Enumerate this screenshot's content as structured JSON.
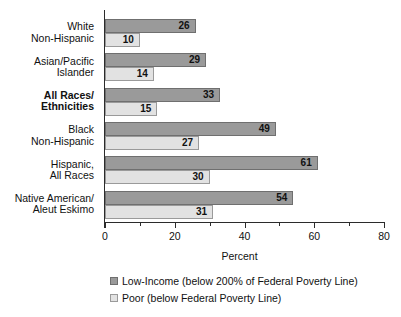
{
  "chart_data": {
    "type": "bar",
    "orientation": "horizontal",
    "title": "",
    "xlabel": "Percent",
    "ylabel": "",
    "xlim": [
      0,
      80
    ],
    "xticks": [
      0,
      20,
      40,
      60,
      80
    ],
    "xtick_labels": [
      "0",
      "20",
      "40",
      "60",
      "80"
    ],
    "minor_xticks": [
      10,
      30,
      50,
      70
    ],
    "grid": false,
    "legend_position": "bottom",
    "categories": [
      "White\nNon-Hispanic",
      "Asian/Pacific\nIslander",
      "All Races/\nEthnicities",
      "Black\nNon-Hispanic",
      "Hispanic,\nAll Races",
      "Native American/\nAleut Eskimo"
    ],
    "series": [
      {
        "name": "Low-Income (below 200% of Federal Poverty Line)",
        "color": "#9a9a9a",
        "values": [
          26,
          29,
          33,
          49,
          61,
          54
        ]
      },
      {
        "name": "Poor (below Federal Poverty Line)",
        "color": "#e2e2e2",
        "values": [
          10,
          14,
          15,
          27,
          30,
          31
        ]
      }
    ]
  },
  "categories": [
    {
      "line1": "White",
      "line2": "Non-Hispanic",
      "bold": false
    },
    {
      "line1": "Asian/Pacific",
      "line2": "Islander",
      "bold": false
    },
    {
      "line1": "All Races/",
      "line2": "Ethnicities",
      "bold": true
    },
    {
      "line1": "Black",
      "line2": "Non-Hispanic",
      "bold": false
    },
    {
      "line1": "Hispanic,",
      "line2": "All Races",
      "bold": false
    },
    {
      "line1": "Native American/",
      "line2": "Aleut Eskimo",
      "bold": false
    }
  ],
  "values": {
    "low_income": [
      "26",
      "29",
      "33",
      "49",
      "61",
      "54"
    ],
    "poor": [
      "10",
      "14",
      "15",
      "27",
      "30",
      "31"
    ]
  },
  "axis": {
    "title": "Percent",
    "tick_labels": [
      "0",
      "20",
      "40",
      "60",
      "80"
    ]
  },
  "legend": [
    {
      "label": "Low-Income (below 200% of Federal Poverty Line)",
      "color": "#9a9a9a",
      "key": "dark"
    },
    {
      "label": "Poor (below Federal Poverty Line)",
      "color": "#e2e2e2",
      "key": "light"
    }
  ]
}
